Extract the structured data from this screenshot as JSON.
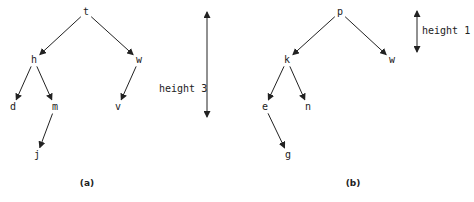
{
  "trees": [
    {
      "caption": "(a)",
      "height_label": "height 3",
      "nodes": {
        "t": {
          "label": "t",
          "x": 86,
          "y": 12
        },
        "h": {
          "label": "h",
          "x": 34,
          "y": 60
        },
        "w": {
          "label": "w",
          "x": 139,
          "y": 60
        },
        "d": {
          "label": "d",
          "x": 13,
          "y": 107
        },
        "m": {
          "label": "m",
          "x": 55,
          "y": 107
        },
        "v": {
          "label": "v",
          "x": 118,
          "y": 107
        },
        "j": {
          "label": "j",
          "x": 37,
          "y": 155
        }
      },
      "edges": [
        [
          "t",
          "h"
        ],
        [
          "t",
          "w"
        ],
        [
          "h",
          "d"
        ],
        [
          "h",
          "m"
        ],
        [
          "w",
          "v"
        ],
        [
          "m",
          "j"
        ]
      ]
    },
    {
      "caption": "(b)",
      "height_label": "height 1",
      "nodes": {
        "p": {
          "label": "p",
          "x": 340,
          "y": 12
        },
        "k": {
          "label": "k",
          "x": 287,
          "y": 60
        },
        "w": {
          "label": "w",
          "x": 392,
          "y": 60
        },
        "e": {
          "label": "e",
          "x": 265,
          "y": 107
        },
        "n": {
          "label": "n",
          "x": 308,
          "y": 107
        },
        "g": {
          "label": "g",
          "x": 288,
          "y": 155
        }
      },
      "edges": [
        [
          "p",
          "k"
        ],
        [
          "p",
          "w"
        ],
        [
          "k",
          "e"
        ],
        [
          "k",
          "n"
        ],
        [
          "e",
          "g"
        ]
      ]
    }
  ]
}
